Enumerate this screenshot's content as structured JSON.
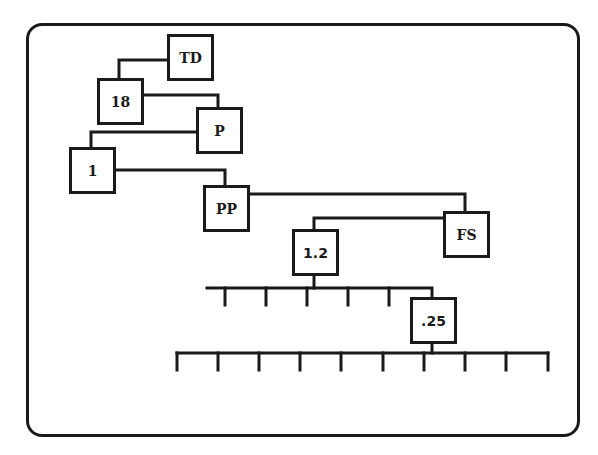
{
  "diagram": {
    "type": "hierarchy-tree",
    "line_color": "#1a1a1a",
    "background": "#ffffff",
    "nodes": {
      "td": {
        "label": "TD"
      },
      "n18": {
        "label": "18"
      },
      "p": {
        "label": "P"
      },
      "n1": {
        "label": "1"
      },
      "pp": {
        "label": "PP"
      },
      "fs": {
        "label": "FS"
      },
      "n1_2": {
        "label": "1.2"
      },
      "n_25": {
        "label": ".25"
      }
    },
    "edges": [
      {
        "from": "TD",
        "to": "18"
      },
      {
        "from": "18",
        "to": "P"
      },
      {
        "from": "P",
        "to": "1"
      },
      {
        "from": "1",
        "to": "PP"
      },
      {
        "from": "PP",
        "to": "FS"
      },
      {
        "from": "FS",
        "to": "1.2"
      },
      {
        "from": "1.2",
        "to": "upper-bus"
      },
      {
        "from": "upper-bus",
        "to": ".25"
      },
      {
        "from": ".25",
        "to": "lower-bus"
      }
    ],
    "upper_bus": {
      "tick_count": 5,
      "branch_to": ".25"
    },
    "lower_bus": {
      "tick_count": 10
    }
  }
}
